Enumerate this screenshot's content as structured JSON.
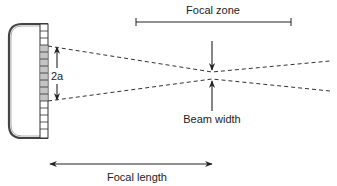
{
  "diagram": {
    "type": "ultrasound-transducer-focusing",
    "labels": {
      "aperture": "2a",
      "focal_zone": "Focal zone",
      "beam_width": "Beam width",
      "focal_length": "Focal length"
    },
    "colors": {
      "stroke": "#222222",
      "active_element": "#bdbdbd",
      "inactive_element": "#ffffff",
      "background": "#ffffff"
    },
    "transducer": {
      "element_count": 16,
      "active_elements": [
        3,
        4,
        5,
        6,
        7,
        8,
        9,
        10,
        11
      ]
    }
  }
}
